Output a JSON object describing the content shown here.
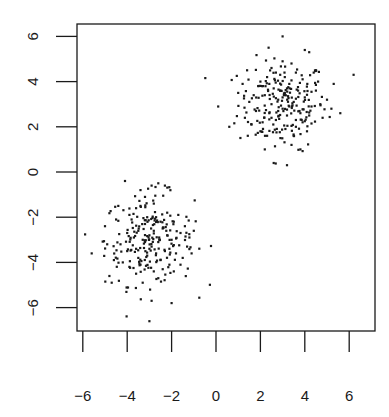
{
  "chart_data": {
    "type": "scatter",
    "title": "",
    "xlabel": "",
    "ylabel": "",
    "xlim": [
      -6.3,
      7.0
    ],
    "ylim": [
      -7.0,
      6.3
    ],
    "grid": false,
    "legend": null,
    "x_ticks": [
      -6,
      -4,
      -2,
      0,
      2,
      4,
      6
    ],
    "x_tick_labels": [
      "−6",
      "−4",
      "−2",
      "0",
      "2",
      "4",
      "6"
    ],
    "y_ticks": [
      -6,
      -4,
      -2,
      0,
      2,
      4,
      6
    ],
    "y_tick_labels": [
      "−6",
      "−4",
      "−2",
      "0",
      "2",
      "4",
      "6"
    ],
    "point_color": "#1a1a1a",
    "series": [
      {
        "name": "cluster-upper-right",
        "center": [
          3,
          3
        ],
        "sd": 1.0,
        "n": 250,
        "points": [
          [
            3.0,
            6.0
          ],
          [
            4.0,
            5.4
          ],
          [
            4.2,
            5.3
          ],
          [
            1.4,
            4.5
          ],
          [
            2.5,
            4.6
          ],
          [
            3.0,
            4.9
          ],
          [
            3.4,
            4.8
          ],
          [
            3.6,
            4.4
          ],
          [
            4.6,
            4.0
          ],
          [
            6.2,
            4.3
          ],
          [
            5.3,
            3.9
          ],
          [
            0.1,
            2.9
          ],
          [
            0.6,
            2.0
          ],
          [
            1.0,
            3.5
          ],
          [
            1.3,
            2.4
          ],
          [
            1.5,
            3.1
          ],
          [
            1.8,
            2.7
          ],
          [
            1.9,
            3.8
          ],
          [
            2.0,
            1.8
          ],
          [
            2.1,
            2.2
          ],
          [
            2.2,
            3.4
          ],
          [
            2.3,
            4.2
          ],
          [
            2.4,
            2.6
          ],
          [
            2.5,
            3.0
          ],
          [
            2.6,
            3.7
          ],
          [
            2.7,
            2.3
          ],
          [
            2.8,
            3.2
          ],
          [
            2.9,
            1.5
          ],
          [
            3.0,
            2.8
          ],
          [
            3.1,
            3.5
          ],
          [
            3.2,
            2.5
          ],
          [
            3.3,
            3.9
          ],
          [
            3.4,
            1.2
          ],
          [
            3.5,
            3.1
          ],
          [
            3.6,
            2.0
          ],
          [
            3.7,
            3.6
          ],
          [
            3.8,
            2.6
          ],
          [
            3.9,
            4.1
          ],
          [
            4.0,
            3.3
          ],
          [
            4.1,
            1.8
          ],
          [
            4.3,
            2.9
          ],
          [
            4.5,
            3.6
          ],
          [
            4.8,
            2.4
          ],
          [
            5.0,
            3.2
          ],
          [
            5.2,
            2.8
          ],
          [
            5.6,
            2.6
          ],
          [
            2.6,
            0.4
          ],
          [
            3.2,
            0.3
          ],
          [
            2.2,
            1.0
          ],
          [
            3.8,
            1.0
          ],
          [
            2.4,
            3.9
          ],
          [
            2.7,
            4.4
          ],
          [
            3.1,
            4.2
          ],
          [
            2.9,
            3.6
          ],
          [
            3.3,
            2.9
          ],
          [
            2.8,
            2.7
          ],
          [
            3.0,
            3.3
          ],
          [
            3.2,
            3.7
          ],
          [
            2.5,
            2.4
          ],
          [
            3.6,
            2.3
          ],
          [
            1.7,
            3.4
          ],
          [
            1.2,
            3.9
          ],
          [
            2.0,
            4.0
          ],
          [
            4.4,
            4.4
          ],
          [
            4.7,
            3.0
          ],
          [
            3.5,
            1.6
          ],
          [
            2.3,
            1.6
          ],
          [
            1.6,
            2.1
          ],
          [
            3.9,
            2.2
          ],
          [
            4.2,
            2.5
          ]
        ]
      },
      {
        "name": "cluster-lower-left",
        "center": [
          -3,
          -3
        ],
        "sd": 1.0,
        "n": 250,
        "points": [
          [
            -4.1,
            -0.4
          ],
          [
            -3.4,
            -0.8
          ],
          [
            -2.9,
            -0.6
          ],
          [
            -2.6,
            -0.5
          ],
          [
            -2.3,
            -0.6
          ],
          [
            -3.2,
            -1.1
          ],
          [
            -3.6,
            -1.6
          ],
          [
            -4.4,
            -1.5
          ],
          [
            -5.0,
            -2.4
          ],
          [
            -5.6,
            -3.6
          ],
          [
            -4.6,
            -3.9
          ],
          [
            -4.8,
            -4.6
          ],
          [
            -4.7,
            -4.9
          ],
          [
            -4.3,
            -3.2
          ],
          [
            -4.0,
            -2.7
          ],
          [
            -3.8,
            -2.1
          ],
          [
            -3.6,
            -3.4
          ],
          [
            -3.5,
            -2.6
          ],
          [
            -3.4,
            -4.1
          ],
          [
            -3.3,
            -3.0
          ],
          [
            -3.2,
            -2.3
          ],
          [
            -3.1,
            -3.7
          ],
          [
            -3.0,
            -2.8
          ],
          [
            -2.9,
            -3.3
          ],
          [
            -2.8,
            -4.4
          ],
          [
            -2.7,
            -2.0
          ],
          [
            -2.6,
            -3.1
          ],
          [
            -2.5,
            -3.9
          ],
          [
            -2.4,
            -2.5
          ],
          [
            -2.3,
            -3.5
          ],
          [
            -2.2,
            -1.8
          ],
          [
            -2.1,
            -4.1
          ],
          [
            -2.0,
            -3.0
          ],
          [
            -1.9,
            -2.2
          ],
          [
            -1.8,
            -3.6
          ],
          [
            -1.6,
            -2.7
          ],
          [
            -1.5,
            -3.8
          ],
          [
            -1.4,
            -2.4
          ],
          [
            -1.3,
            -3.3
          ],
          [
            -1.2,
            -2.9
          ],
          [
            -1.0,
            -2.6
          ],
          [
            -2.9,
            -5.7
          ],
          [
            -2.0,
            -5.8
          ],
          [
            -3.0,
            -6.6
          ],
          [
            -3.3,
            -4.9
          ],
          [
            -3.6,
            -4.5
          ],
          [
            -2.6,
            -4.7
          ],
          [
            -3.9,
            -4.2
          ],
          [
            -2.4,
            -4.3
          ],
          [
            -4.2,
            -4.0
          ],
          [
            -3.7,
            -2.9
          ],
          [
            -3.0,
            -3.4
          ],
          [
            -2.8,
            -2.6
          ],
          [
            -3.2,
            -3.1
          ],
          [
            -2.7,
            -3.6
          ],
          [
            -3.5,
            -3.8
          ],
          [
            -2.5,
            -2.2
          ],
          [
            -2.2,
            -2.8
          ],
          [
            -1.7,
            -1.9
          ],
          [
            -4.5,
            -2.1
          ],
          [
            -3.9,
            -1.9
          ],
          [
            -1.9,
            -4.4
          ],
          [
            -3.1,
            -2.0
          ],
          [
            -4.0,
            -3.5
          ],
          [
            -2.1,
            -3.4
          ],
          [
            -1.6,
            -4.1
          ],
          [
            -3.4,
            -1.5
          ],
          [
            -2.8,
            -1.4
          ],
          [
            -4.9,
            -3.2
          ],
          [
            -1.1,
            -3.6
          ]
        ]
      }
    ]
  }
}
